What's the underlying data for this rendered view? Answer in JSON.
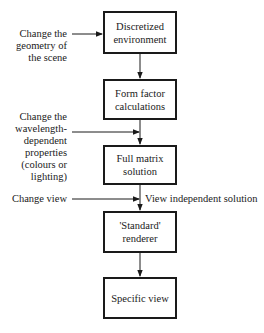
{
  "diagram": {
    "type": "flowchart",
    "nodes": [
      {
        "id": "discretized",
        "label": "Discretized\nenvironment"
      },
      {
        "id": "form_factor",
        "label": "Form factor\ncalculations"
      },
      {
        "id": "full_matrix",
        "label": "Full matrix\nsolution"
      },
      {
        "id": "standard_renderer",
        "label": "'Standard'\nrenderer"
      },
      {
        "id": "specific_view",
        "label": "Specific view"
      }
    ],
    "inputs": [
      {
        "id": "change_geometry",
        "label": "Change the\ngeometry of\nthe scene",
        "target": "discretized"
      },
      {
        "id": "change_wavelength",
        "label": "Change the\nwavelength-\ndependent\nproperties\n(colours or\nlighting)",
        "target": "form_factor->full_matrix"
      },
      {
        "id": "change_view",
        "label": "Change view",
        "target": "full_matrix->standard_renderer"
      }
    ],
    "annotations": [
      {
        "id": "view_independent",
        "label": "View independent solution"
      }
    ],
    "edges": [
      {
        "from": "discretized",
        "to": "form_factor"
      },
      {
        "from": "form_factor",
        "to": "full_matrix"
      },
      {
        "from": "full_matrix",
        "to": "standard_renderer"
      },
      {
        "from": "standard_renderer",
        "to": "specific_view"
      }
    ]
  }
}
